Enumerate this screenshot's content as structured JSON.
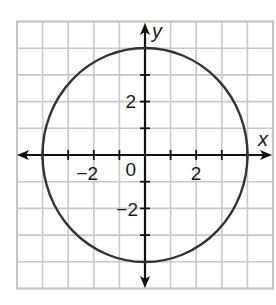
{
  "chart_data": {
    "type": "line",
    "title": "",
    "equation": "x^2 + y^2 = 16",
    "curve": {
      "shape": "circle",
      "center": [
        0,
        0
      ],
      "radius": 4
    },
    "key_points": [
      [
        4,
        0
      ],
      [
        0,
        4
      ],
      [
        -4,
        0
      ],
      [
        0,
        -4
      ]
    ],
    "xlabel": "x",
    "ylabel": "y",
    "xlim": [
      -5,
      5
    ],
    "ylim": [
      -5,
      5
    ],
    "grid": true,
    "grid_step": 1,
    "x_tick_labels": [
      {
        "value": -2,
        "text": "−2"
      },
      {
        "value": 0,
        "text": "0"
      },
      {
        "value": 2,
        "text": "2"
      }
    ],
    "y_tick_labels": [
      {
        "value": 2,
        "text": "2"
      },
      {
        "value": -2,
        "text": "−2"
      }
    ],
    "legend": null
  },
  "colors": {
    "grid": "#c8c8c8",
    "axes": "#111111",
    "curve": "#333333",
    "background": "#ffffff"
  },
  "labels": {
    "x_axis": "x",
    "y_axis": "y",
    "origin": "0",
    "x_neg2": "−2",
    "x_pos2": "2",
    "y_pos2": "2",
    "y_neg2": "−2"
  }
}
